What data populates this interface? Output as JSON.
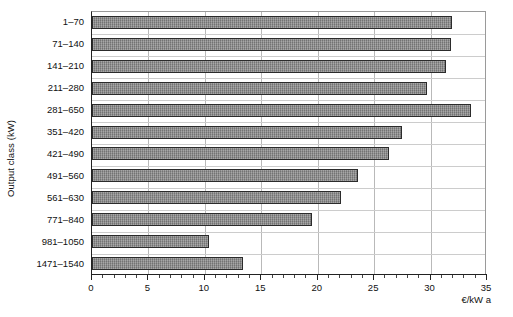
{
  "chart_data": {
    "type": "bar",
    "orientation": "horizontal",
    "title": "",
    "xlabel": "€/kW a",
    "ylabel": "Output class (kW)",
    "xlim": [
      0,
      35
    ],
    "xticks": [
      0,
      5,
      10,
      15,
      20,
      25,
      30,
      35
    ],
    "xtick_labels": [
      "0",
      "5",
      "10",
      "15",
      "20",
      "25",
      "30",
      "35"
    ],
    "minor_tick_step": 1,
    "grid": "both",
    "legend": "none",
    "bar_color": "#8a8a8a",
    "bar_edge_color": "#2b2b2b",
    "categories": [
      "1–70",
      "71–140",
      "141–210",
      "211–280",
      "281–650",
      "351–420",
      "421–490",
      "491–560",
      "561–630",
      "771–840",
      "981–1050",
      "1471–1540"
    ],
    "values": [
      31.9,
      31.8,
      31.4,
      29.7,
      33.6,
      27.5,
      26.3,
      23.6,
      22.1,
      19.5,
      10.4,
      13.4
    ]
  }
}
